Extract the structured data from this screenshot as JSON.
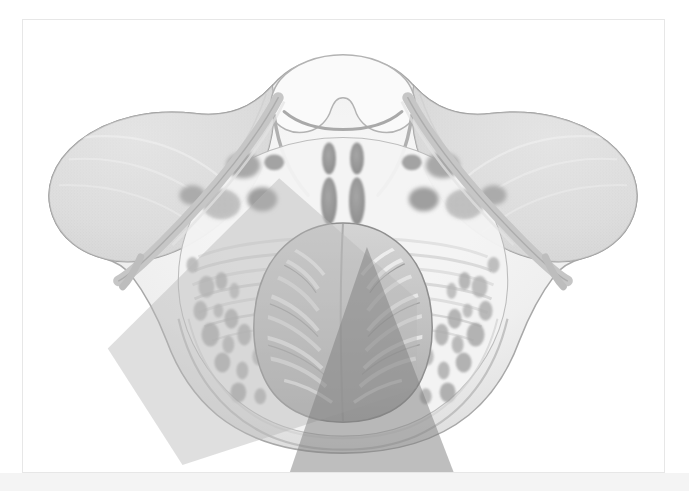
{
  "figure": {
    "title": "Axial cross-section of pons, cerebellum and middle cerebellar peduncles",
    "caption": "",
    "panel": {
      "background_color": "#ffffff",
      "border_color": "#e7e7e7",
      "x": 22,
      "y": 19,
      "width": 643,
      "height": 454
    },
    "page": {
      "background_color": "#ffffff",
      "bottom_strip_color": "#f4f4f4"
    },
    "rendering": {
      "style": "grayscale stippled medical illustration",
      "colors": {
        "outline": "#9a9a9a",
        "parenchyma_light": "#f2f2f2",
        "parenchyma_mid": "#d8d8d8",
        "parenchyma_dark": "#b4b4b4",
        "nuclei_dark": "#9c9c9c",
        "cerebellum_mid": "#c6c6c6",
        "cerebellum_shadow": "#9f9f9f",
        "stipple": "#bdbdbd",
        "fiber_streak": "#e4e4e4"
      }
    },
    "structures": [
      {
        "name": "superior-velum-arch",
        "label": "superior medullary velum / roof arch",
        "region": "midline-superior"
      },
      {
        "name": "left-cerebellar-hemisphere-wing",
        "label": "left cerebellar hemisphere (lateral wing)",
        "region": "left-lateral"
      },
      {
        "name": "right-cerebellar-hemisphere-wing",
        "label": "right cerebellar hemisphere (lateral wing)",
        "region": "right-lateral"
      },
      {
        "name": "pontine-tegmentum",
        "label": "pontine tegmentum",
        "region": "central-superior"
      },
      {
        "name": "transverse-pontine-fibers",
        "label": "transverse pontine fibres",
        "region": "central"
      },
      {
        "name": "dentate-nuclei",
        "label": "deep cerebellar (dentate) nuclei",
        "region": "paramedian"
      },
      {
        "name": "cerebellar-vermis-folia",
        "label": "cerebellar vermis with folia",
        "region": "inferior-midline"
      },
      {
        "name": "middle-cerebellar-peduncle",
        "label": "middle cerebellar peduncle",
        "region": "bilateral-oblique"
      }
    ],
    "overlays": [
      {
        "name": "light-beam-overlay",
        "label": "light translucent approach corridor",
        "fill_color": "#b9b9b9",
        "opacity": 0.45,
        "direction": "down-left",
        "points": "85,330 257,159 395,280 395,370 160,447"
      },
      {
        "name": "dark-cone-overlay",
        "label": "dark translucent conical approach corridor",
        "fill_color": "#7e7e7e",
        "opacity": 0.5,
        "direction": "down, apex superior",
        "points": "345,228 435,462 265,462"
      }
    ]
  }
}
